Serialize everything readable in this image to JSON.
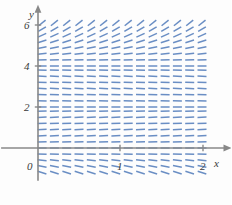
{
  "figure": {
    "kind": "slope-field",
    "background_color": "#fdfdfd"
  },
  "colors": {
    "segment": "#6a8ec4",
    "axis": "#888888",
    "text": "#3a3a3a"
  },
  "axes": {
    "x_axis": {
      "label": "x",
      "label_x": 214,
      "label_y": 158,
      "ticks": [
        {
          "value": 1,
          "text": "1",
          "px": 120,
          "label_x": 117,
          "label_y": 161
        },
        {
          "value": 2,
          "text": "2",
          "px": 203,
          "label_x": 200,
          "label_y": 161
        }
      ],
      "range": [
        -0.45,
        2.25
      ],
      "arrow": true
    },
    "y_axis": {
      "label": "y",
      "label_x": 29,
      "label_y": 9,
      "ticks": [
        {
          "value": 2,
          "text": "2",
          "px": 107,
          "label_x": 24,
          "label_y": 102
        },
        {
          "value": 4,
          "text": "4",
          "px": 66,
          "label_x": 24,
          "label_y": 61
        },
        {
          "value": 6,
          "text": "6",
          "px": 25,
          "label_x": 24,
          "label_y": 20
        }
      ],
      "range": [
        -1.6,
        6.6
      ],
      "arrow": true
    },
    "origin": {
      "text": "0",
      "label_x": 27,
      "label_y": 161,
      "px_x": 38,
      "px_y": 148
    }
  },
  "chart_data": {
    "type": "scatter",
    "title": "",
    "xlabel": "x",
    "ylabel": "y",
    "xlim": [
      -0.45,
      2.25
    ],
    "ylim": [
      -1.6,
      6.6
    ],
    "grid": false,
    "legend": null,
    "equation_description": "Direction field of an autonomous differential equation dy/dx = f(y) with equilibrium solutions at y = 0, y = 2 and y = 4",
    "equilibria": [
      0,
      2,
      4
    ],
    "slope_rule": "proportional to y*(y-2)*(y-4), clamped",
    "slope_sign_by_band": [
      {
        "band": "y < 0",
        "sign": "negative-steep"
      },
      {
        "band": "0 < y < 2",
        "sign": "positive"
      },
      {
        "band": "2 < y < 4",
        "sign": "negative"
      },
      {
        "band": "y > 4",
        "sign": "positive-steep"
      }
    ],
    "sample_x": [
      0.05,
      0.2,
      0.35,
      0.5,
      0.65,
      0.8,
      0.95,
      1.1,
      1.25,
      1.4,
      1.55,
      1.7,
      1.85,
      2.0
    ],
    "sample_y": [
      -1.2,
      -0.9,
      -0.6,
      -0.3,
      0.0,
      0.3,
      0.6,
      0.9,
      1.2,
      1.5,
      1.8,
      2.0,
      2.3,
      2.6,
      2.9,
      3.2,
      3.5,
      3.8,
      4.0,
      4.3,
      4.6,
      4.9,
      5.2,
      5.5,
      5.8,
      6.1
    ],
    "segment_count": 364,
    "segment_length_px": 9
  }
}
